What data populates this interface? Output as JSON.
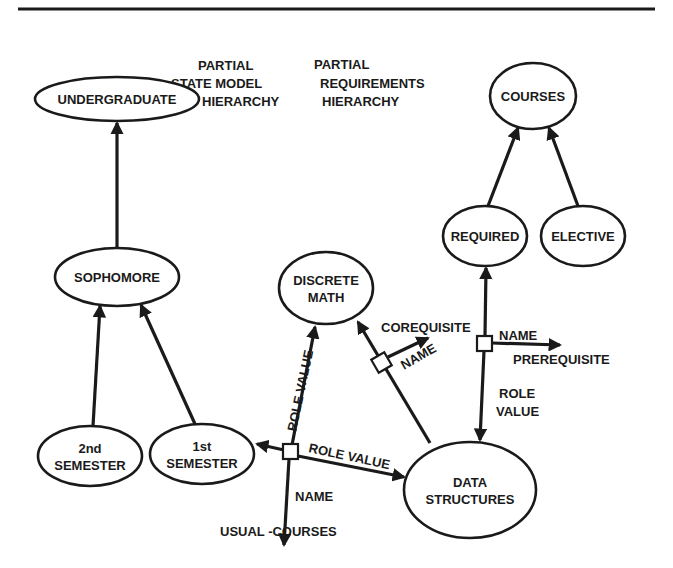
{
  "figure": {
    "headings": [
      {
        "id": "state",
        "lines": [
          "PARTIAL",
          "STATE MODEL",
          "HIERARCHY"
        ]
      },
      {
        "id": "req",
        "lines": [
          "PARTIAL",
          "REQUIREMENTS",
          "HIERARCHY"
        ]
      }
    ],
    "nodes": [
      {
        "id": "undergraduate",
        "lines": [
          "UNDERGRADUATE"
        ],
        "cx": 117,
        "cy": 99,
        "rx": 82,
        "ry": 22
      },
      {
        "id": "sophomore",
        "lines": [
          "SOPHOMORE"
        ],
        "cx": 117,
        "cy": 277,
        "rx": 62,
        "ry": 29
      },
      {
        "id": "2nd-semester",
        "lines": [
          "2nd",
          "SEMESTER"
        ],
        "cx": 90,
        "cy": 456,
        "rx": 52,
        "ry": 30
      },
      {
        "id": "1st-semester",
        "lines": [
          "1st",
          "SEMESTER"
        ],
        "cx": 202,
        "cy": 454,
        "rx": 52,
        "ry": 30
      },
      {
        "id": "discrete-math",
        "lines": [
          "DISCRETE",
          "MATH"
        ],
        "cx": 326,
        "cy": 288,
        "rx": 47,
        "ry": 36
      },
      {
        "id": "courses",
        "lines": [
          "COURSES"
        ],
        "cx": 533,
        "cy": 96,
        "rx": 43,
        "ry": 33
      },
      {
        "id": "required",
        "lines": [
          "REQUIRED"
        ],
        "cx": 485,
        "cy": 236,
        "rx": 42,
        "ry": 30
      },
      {
        "id": "elective",
        "lines": [
          "ELECTIVE"
        ],
        "cx": 583,
        "cy": 236,
        "rx": 42,
        "ry": 30
      },
      {
        "id": "data-structures",
        "lines": [
          "DATA",
          "STRUCTURES"
        ],
        "cx": 470,
        "cy": 490,
        "rx": 66,
        "ry": 48
      }
    ],
    "labels": {
      "role_value_vertical": "ROLE VALUE",
      "role_value_diag": "ROLE VALUE",
      "name_bottom": "NAME",
      "usual_courses": "USUAL -COURSES",
      "corequisite": "COREQUISITE",
      "name_coreq": "NAME",
      "name_prereq": "NAME",
      "prerequisite": "PREREQUISITE",
      "role_value_right_1": "ROLE",
      "role_value_right_2": "VALUE"
    },
    "edges": [
      {
        "from": "sophomore",
        "to": "undergraduate",
        "type": "is-a"
      },
      {
        "from": "2nd-semester",
        "to": "sophomore",
        "type": "is-a"
      },
      {
        "from": "1st-semester",
        "to": "sophomore",
        "type": "is-a"
      },
      {
        "from": "required",
        "to": "courses",
        "type": "is-a"
      },
      {
        "from": "elective",
        "to": "courses",
        "type": "is-a"
      },
      {
        "relation": "USUAL-COURSES",
        "domain": "1st-semester",
        "value": "discrete-math / data-structures"
      },
      {
        "relation": "COREQUISITE",
        "domain": "data-structures",
        "value": "discrete-math"
      },
      {
        "relation": "PREREQUISITE",
        "domain": "required",
        "value": "data-structures"
      }
    ]
  }
}
